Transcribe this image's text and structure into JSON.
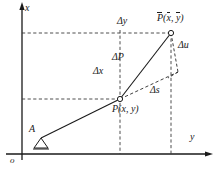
{
  "figure": {
    "background_color": "#ffffff",
    "ink_color": "#1a1a1a",
    "width": 218,
    "height": 177
  },
  "axes": {
    "vertical_label": "x",
    "horizontal_label": "y",
    "origin_label": "o",
    "vertical_axis_name": "x-axis",
    "horizontal_axis_name": "y-axis"
  },
  "points": {
    "P": {
      "label": "P(x, y)",
      "label_prefix": "P(",
      "label_x": "x",
      "label_mid": ", ",
      "label_y": "y",
      "label_suffix": ")",
      "marker": "open-circle",
      "px": 120,
      "py": 99
    },
    "P_bar": {
      "label": "P̄(x̄, ȳ)",
      "label_prefix": "P",
      "label_open": "(",
      "label_x": "x",
      "label_mid": ", ",
      "label_y": "y",
      "label_close": ")",
      "marker": "open-circle",
      "px": 171,
      "py": 33
    },
    "A": {
      "label": "A",
      "marker": "triangle-support",
      "px": 37,
      "py": 139
    }
  },
  "segments": {
    "delta_P": {
      "label": "ΔP",
      "style": "solid",
      "description": "vector from P to P-bar"
    },
    "delta_x": {
      "label": "Δx",
      "style": "dashed",
      "description": "vertical projection between horizontal guide lines"
    },
    "delta_y": {
      "label": "Δy",
      "style": "dashed",
      "description": "horizontal projection along top guide line"
    },
    "delta_s": {
      "label": "Δs",
      "style": "dashed",
      "description": "extension of rigid body line from P"
    },
    "delta_u": {
      "label": "Δu",
      "style": "dashed",
      "description": "deformation component at P-bar"
    }
  },
  "guides": {
    "top_horizontal": "dashed guide from x-axis to P-bar level",
    "mid_horizontal": "dashed guide from x-axis to P level",
    "left_vertical": "dashed guide through P down to y-axis",
    "right_vertical": "dashed guide through P-bar down to y-axis"
  }
}
